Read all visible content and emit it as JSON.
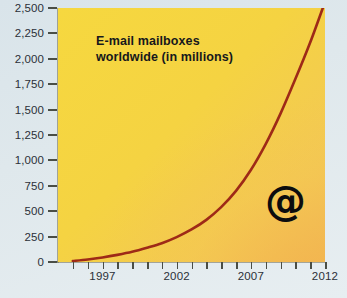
{
  "chart_data": {
    "type": "line",
    "title": "E-mail mailboxes\nworldwide (in millions)",
    "subtitle": "",
    "xlabel": "",
    "ylabel": "",
    "xlim": [
      1994,
      2012
    ],
    "ylim": [
      0,
      2500
    ],
    "grid": false,
    "legend": null,
    "annotations": [
      {
        "name": "at-symbol",
        "text": "@",
        "x": 2008.6,
        "y": 520
      }
    ],
    "y_ticks": [
      0,
      250,
      500,
      750,
      1000,
      1250,
      1500,
      1750,
      2000,
      2250,
      2500
    ],
    "y_tick_labels": [
      "0",
      "250",
      "500",
      "750",
      "1,000",
      "1,250",
      "1,500",
      "1,750",
      "2,000",
      "2,250",
      "2,500"
    ],
    "x_ticks": [
      1995,
      1996,
      1997,
      1998,
      1999,
      2000,
      2001,
      2002,
      2003,
      2004,
      2005,
      2006,
      2007,
      2008,
      2009,
      2010,
      2011,
      2012
    ],
    "x_tick_labels_shown": [
      "1997",
      "2002",
      "2007",
      "2012"
    ],
    "x_label_positions": [
      1997,
      2002,
      2007,
      2012
    ],
    "series": [
      {
        "name": "E-mail mailboxes worldwide",
        "color": "#9e2a17",
        "x": [
          1995,
          1996,
          1997,
          1998,
          1999,
          2000,
          2001,
          2002,
          2003,
          2004,
          2005,
          2006,
          2007,
          2008,
          2009,
          2010,
          2011,
          2012
        ],
        "values": [
          10,
          25,
          45,
          70,
          100,
          140,
          185,
          245,
          320,
          415,
          540,
          700,
          905,
          1160,
          1460,
          1800,
          2160,
          2560
        ]
      }
    ],
    "colors": {
      "plot_background_start": "#f6d83f",
      "plot_background_end": "#f1bc5c",
      "page_background": "#d9e4ea",
      "line": "#9e2a17",
      "axis": "#4a4e46",
      "text": "#2b3038",
      "title_text": "#16181c"
    }
  }
}
